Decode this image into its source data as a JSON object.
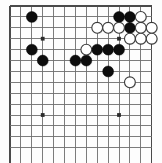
{
  "diagram": {
    "board_type": "go-board",
    "colors": {
      "background": "#fdfdfd",
      "grid": "#6e6e6e",
      "edge": "#4a4a4a",
      "black_stone": "#0d0d0d",
      "white_stone": "#ffffff",
      "white_stone_outline": "#3a3a3a",
      "star_point": "#2b2b2b"
    },
    "geometry": {
      "origin_x": 10,
      "origin_y": 6,
      "spacing": 10.9,
      "cols": 14,
      "rows": 14,
      "stone_radius": 5.4,
      "star_radius": 1.9
    },
    "grid": {
      "columns": 14,
      "rows": 14,
      "visible_edges": [
        "top",
        "left",
        "right"
      ],
      "note": "partial board view, cropped at bottom"
    },
    "star_points": [
      {
        "col": 3,
        "row": 10
      },
      {
        "col": 10,
        "row": 10
      },
      {
        "col": 3,
        "row": 3
      },
      {
        "col": 10,
        "row": 3
      }
    ],
    "stones": [
      {
        "color": "black",
        "col": 2,
        "row": 1
      },
      {
        "color": "black",
        "col": 2,
        "row": 4
      },
      {
        "color": "black",
        "col": 3,
        "row": 5
      },
      {
        "color": "black",
        "col": 6,
        "row": 5
      },
      {
        "color": "black",
        "col": 7,
        "row": 5
      },
      {
        "color": "black",
        "col": 8,
        "row": 4
      },
      {
        "color": "black",
        "col": 9,
        "row": 4
      },
      {
        "color": "black",
        "col": 10,
        "row": 4
      },
      {
        "color": "black",
        "col": 9,
        "row": 6
      },
      {
        "color": "black",
        "col": 10,
        "row": 1
      },
      {
        "color": "black",
        "col": 11,
        "row": 1
      },
      {
        "color": "black",
        "col": 11,
        "row": 2
      },
      {
        "color": "white",
        "col": 7,
        "row": 4
      },
      {
        "color": "white",
        "col": 8,
        "row": 2
      },
      {
        "color": "white",
        "col": 9,
        "row": 2
      },
      {
        "color": "white",
        "col": 10,
        "row": 2
      },
      {
        "color": "white",
        "col": 12,
        "row": 1
      },
      {
        "color": "white",
        "col": 12,
        "row": 2
      },
      {
        "color": "white",
        "col": 11,
        "row": 3
      },
      {
        "color": "white",
        "col": 12,
        "row": 3
      },
      {
        "color": "white",
        "col": 13,
        "row": 2
      },
      {
        "color": "white",
        "col": 13,
        "row": 3
      },
      {
        "color": "white",
        "col": 11,
        "row": 7
      }
    ],
    "counts": {
      "black_stones": 12,
      "white_stones": 11,
      "total_stones": 23
    }
  }
}
